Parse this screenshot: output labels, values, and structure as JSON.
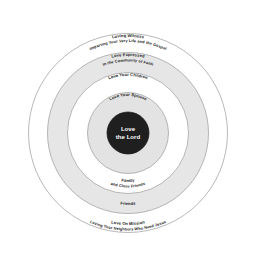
{
  "diagram": {
    "type": "concentric-circles",
    "center": {
      "label_line1": "Love",
      "label_line2": "the Lord",
      "fill": "#1f1f1f",
      "text_color": "#ffffff"
    },
    "colors": {
      "background": "#ffffff",
      "band_light": "#ffffff",
      "band_gray": "#e6e6e6",
      "band_gray_2": "#ededed",
      "outline": "#999999",
      "text": "#1a1a1a"
    },
    "rings": [
      {
        "index": 1,
        "name": "spouse",
        "fill": "#e3e3e3",
        "top_labels": [
          "Love Your Spouse"
        ],
        "bottom_labels": []
      },
      {
        "index": 2,
        "name": "children",
        "fill": "#ffffff",
        "top_labels": [
          "Love Your Children"
        ],
        "bottom_labels": [
          "Family",
          "and Close Friends"
        ]
      },
      {
        "index": 3,
        "name": "community-of-faith",
        "fill": "#e6e6e6",
        "top_labels": [
          "Love Expressed",
          "In the Community of Faith"
        ],
        "bottom_labels": [
          "Friends"
        ]
      },
      {
        "index": 4,
        "name": "loving-witness",
        "fill": "#ffffff",
        "top_labels": [
          "Loving Witness",
          "Imparting Your Very Life and the Gospel"
        ],
        "bottom_labels": [
          "Love On Mission",
          "Loving Your Neighbors Who Need Jesus"
        ]
      }
    ],
    "labels": {
      "loving_witness": "Loving Witness",
      "imparting": "Imparting Your Very Life and the Gospel",
      "love_expressed": "Love Expressed",
      "community_of_faith": "In the Community of Faith",
      "love_your_children": "Love Your Children",
      "love_your_spouse": "Love Your Spouse",
      "center_line1": "Love",
      "center_line2": "the Lord",
      "family": "Family",
      "close_friends": "and Close Friends",
      "friends": "Friends",
      "love_on_mission": "Love On Mission",
      "loving_neighbors": "Loving Your Neighbors Who Need Jesus"
    }
  }
}
